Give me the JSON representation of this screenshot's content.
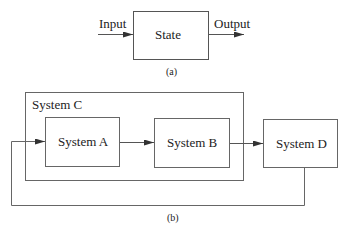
{
  "diagram_a": {
    "input_label": "Input",
    "state_label": "State",
    "output_label": "Output",
    "caption": "(a)"
  },
  "diagram_b": {
    "container_label": "System C",
    "system_a": "System A",
    "system_b": "System B",
    "system_d": "System D",
    "caption": "(b)"
  }
}
